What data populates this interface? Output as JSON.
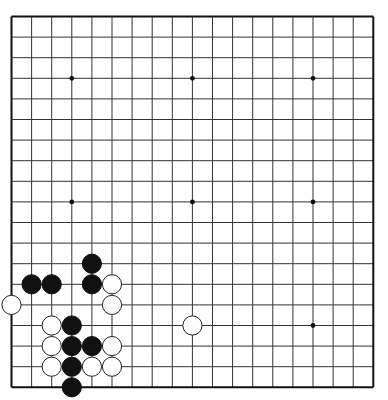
{
  "board": {
    "size": 19,
    "origin_x": 11.5,
    "origin_y": 16.5,
    "spacing_x": 20.1,
    "spacing_y": 20.6,
    "stone_radius": 9.6,
    "colors": {
      "background": "#ffffff",
      "line": "#333333",
      "border": "#111111",
      "black_stone": "#111111",
      "white_stone": "#ffffff",
      "white_outline": "#222222",
      "star": "#111111"
    },
    "star_points": [
      [
        3,
        3
      ],
      [
        9,
        3
      ],
      [
        15,
        3
      ],
      [
        3,
        9
      ],
      [
        9,
        9
      ],
      [
        15,
        9
      ],
      [
        3,
        15
      ],
      [
        9,
        15
      ],
      [
        15,
        15
      ]
    ],
    "stones": [
      {
        "color": "black",
        "col": 4,
        "row": 12
      },
      {
        "color": "black",
        "col": 1,
        "row": 13
      },
      {
        "color": "black",
        "col": 2,
        "row": 13
      },
      {
        "color": "black",
        "col": 4,
        "row": 13
      },
      {
        "color": "white",
        "col": 5,
        "row": 13
      },
      {
        "color": "white",
        "col": 0,
        "row": 14
      },
      {
        "color": "white",
        "col": 5,
        "row": 14
      },
      {
        "color": "white",
        "col": 2,
        "row": 15
      },
      {
        "color": "black",
        "col": 3,
        "row": 15
      },
      {
        "color": "white",
        "col": 9,
        "row": 15
      },
      {
        "color": "white",
        "col": 2,
        "row": 16
      },
      {
        "color": "black",
        "col": 3,
        "row": 16
      },
      {
        "color": "black",
        "col": 4,
        "row": 16
      },
      {
        "color": "white",
        "col": 5,
        "row": 16
      },
      {
        "color": "white",
        "col": 2,
        "row": 17
      },
      {
        "color": "black",
        "col": 3,
        "row": 17
      },
      {
        "color": "white",
        "col": 4,
        "row": 17
      },
      {
        "color": "white",
        "col": 5,
        "row": 17
      },
      {
        "color": "black",
        "col": 3,
        "row": 18
      }
    ]
  }
}
